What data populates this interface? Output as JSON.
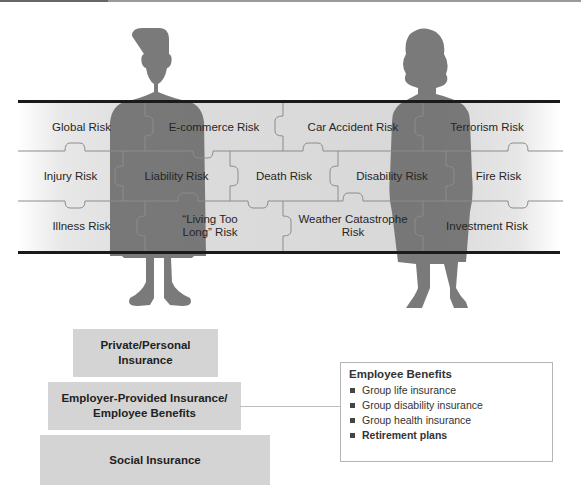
{
  "diagram": {
    "risk_grid": {
      "rows": [
        [
          {
            "label": "Global Risk"
          },
          {
            "label": "E-commerce Risk"
          },
          {
            "label": "Car Accident Risk"
          },
          {
            "label": "Terrorism Risk"
          }
        ],
        [
          {
            "label": "Injury Risk"
          },
          {
            "label": "Liability Risk"
          },
          {
            "label": "Death Risk"
          },
          {
            "label": "Disability Risk"
          },
          {
            "label": "Fire Risk"
          }
        ],
        [
          {
            "label": "Illness Risk"
          },
          {
            "label": "“Living Too Long” Risk"
          },
          {
            "label": "Weather Catastrophe Risk"
          },
          {
            "label": "Investment Risk"
          }
        ]
      ]
    },
    "figures": [
      {
        "type": "male-silhouette"
      },
      {
        "type": "female-silhouette"
      }
    ],
    "pyramid": [
      {
        "line1": "Private/Personal",
        "line2": "Insurance"
      },
      {
        "line1": "Employer-Provided Insurance/",
        "line2": "Employee Benefits"
      },
      {
        "line1": "Social Insurance",
        "line2": ""
      }
    ],
    "employee_benefits": {
      "title": "Employee Benefits",
      "items": [
        {
          "label": "Group life insurance",
          "bold": false
        },
        {
          "label": "Group disability insurance",
          "bold": false
        },
        {
          "label": "Group health insurance",
          "bold": false
        },
        {
          "label": "Retirement plans",
          "bold": true
        }
      ]
    },
    "colors": {
      "silhouette": "#6f6f6f",
      "band": "#dadada",
      "band_border": "#1a1a1a",
      "pyramid_box": "#d4d4d4"
    }
  }
}
